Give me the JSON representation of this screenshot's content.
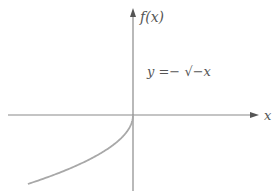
{
  "chart_data": {
    "type": "line",
    "title": "",
    "xlabel": "x",
    "ylabel": "f(x)",
    "equation_label": "y =− √−x",
    "function": "y = -sqrt(-x)",
    "domain": [
      -2.32,
      0
    ],
    "series": [
      {
        "name": "y = -sqrt(-x)",
        "x": [
          -2.32,
          -2.0,
          -1.5,
          -1.0,
          -0.5,
          -0.25,
          -0.1,
          0
        ],
        "y": [
          -1.52,
          -1.414,
          -1.225,
          -1.0,
          -0.707,
          -0.5,
          -0.316,
          0
        ]
      }
    ],
    "axes": {
      "origin_px": [
        133,
        115
      ],
      "scale_px_per_unit": 45.3,
      "x_arrow": true,
      "y_arrow": true
    },
    "grid": false,
    "legend": null,
    "colors": {
      "axis": "#8a8a8a",
      "curve": "#a8a8a8",
      "text": "#555555"
    }
  },
  "labels": {
    "y_axis": "f(x)",
    "x_axis": "x",
    "equation": "y =− √−x"
  }
}
